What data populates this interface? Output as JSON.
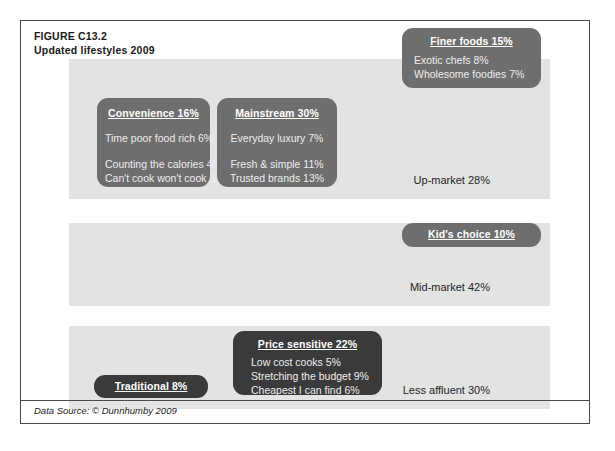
{
  "figure": {
    "number": "FIGURE C13.2",
    "title": "Updated lifestyles 2009",
    "source": "Data Source: © Dunnhumby 2009"
  },
  "bands": [
    {
      "id": "up-market",
      "label": "Up-market 28%"
    },
    {
      "id": "mid-market",
      "label": "Mid-market 42%"
    },
    {
      "id": "less-affluent",
      "label": "Less affluent 30%"
    }
  ],
  "segments": {
    "finer_foods": {
      "title": "Finer foods 15%",
      "items": [
        "Exotic chefs 8%",
        "Wholesome foodies 7%"
      ]
    },
    "convenience": {
      "title": "Convenience 16%",
      "items": [
        "Time poor food rich 6%",
        "Counting the calories 4%",
        "Can't cook won't cook 5%"
      ]
    },
    "mainstream": {
      "title": "Mainstream 30%",
      "items": [
        "Everyday luxury 7%",
        "Fresh & simple 11%",
        "Trusted brands 13%"
      ]
    },
    "kids_choice": {
      "title": "Kid's choice 10%",
      "items": []
    },
    "price_sensitive": {
      "title": "Price sensitive 22%",
      "items": [
        "Low cost cooks 5%",
        "Stretching the budget 9%",
        "Cheapest I can find 6%"
      ]
    },
    "traditional": {
      "title": "Traditional 8%",
      "items": []
    }
  },
  "chart_data": {
    "type": "bar",
    "title": "Updated lifestyles 2009",
    "xlabel": "",
    "ylabel": "",
    "categories": [
      "Up-market",
      "Mid-market",
      "Less affluent"
    ],
    "values": [
      28,
      42,
      30
    ],
    "grid": false,
    "legend": "none",
    "segments": [
      {
        "band": "Up-market 28%",
        "name": "Finer foods",
        "value": 15,
        "subsegments": [
          {
            "name": "Exotic chefs",
            "value": 8
          },
          {
            "name": "Wholesome foodies",
            "value": 7
          }
        ]
      },
      {
        "band": "Up-market 28%",
        "name": "Convenience",
        "value": 16,
        "subsegments": [
          {
            "name": "Time poor food rich",
            "value": 6
          },
          {
            "name": "Counting the calories",
            "value": 4
          },
          {
            "name": "Can't cook won't cook",
            "value": 5
          }
        ]
      },
      {
        "band": "Up-market 28%",
        "name": "Mainstream",
        "value": 30,
        "subsegments": [
          {
            "name": "Everyday luxury",
            "value": 7
          },
          {
            "name": "Fresh & simple",
            "value": 11
          },
          {
            "name": "Trusted brands",
            "value": 13
          }
        ]
      },
      {
        "band": "Mid-market 42%",
        "name": "Kid's choice",
        "value": 10,
        "subsegments": []
      },
      {
        "band": "Less affluent 30%",
        "name": "Price sensitive",
        "value": 22,
        "subsegments": [
          {
            "name": "Low cost cooks",
            "value": 5
          },
          {
            "name": "Stretching the budget",
            "value": 9
          },
          {
            "name": "Cheapest I can find",
            "value": 6
          }
        ]
      },
      {
        "band": "Less affluent 30%",
        "name": "Traditional",
        "value": 8,
        "subsegments": []
      }
    ]
  },
  "colors": {
    "band_fill": "#e3e3e3",
    "box_mid": "#6e6e6e",
    "box_dark": "#3a3a3a",
    "frame_border": "#4a4a4a",
    "text_dark": "#1a1a1a",
    "text_light": "#ffffff"
  }
}
